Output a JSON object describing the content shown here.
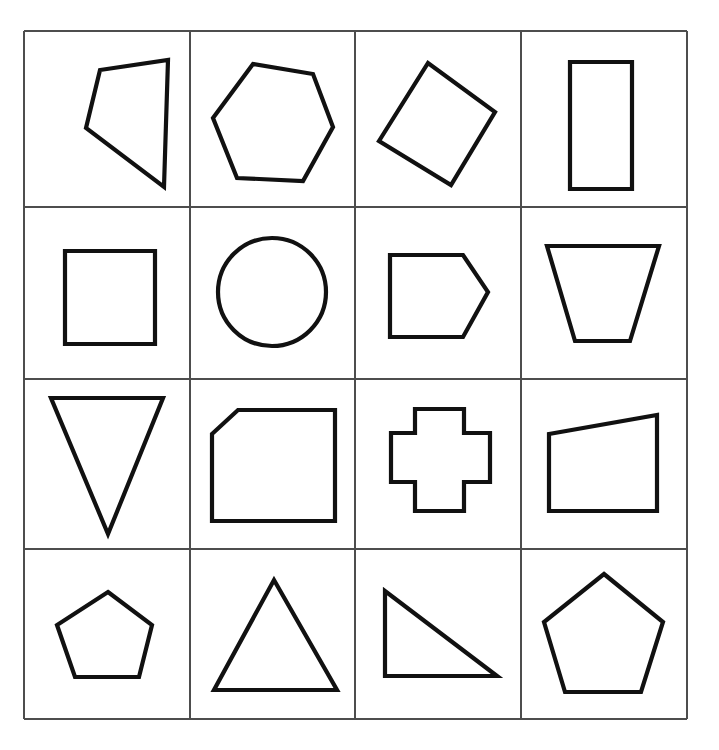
{
  "figure": {
    "rows": 4,
    "columns": 4,
    "shape_count": 16,
    "background_color": "#ffffff",
    "shape_stroke_color": "#111111",
    "shape_fill": "none",
    "shape_stroke_width": 4.2,
    "grid_line_color": "#4d4d4d",
    "grid_line_width": 1.4
  },
  "grid": {
    "x_positions": [
      24,
      190,
      355,
      521,
      687
    ],
    "y_positions": [
      31,
      207,
      379,
      549,
      719
    ]
  },
  "cells": [
    {
      "index": 0,
      "row": 1,
      "column": 1,
      "shape_name": "rotated-rectangle",
      "label": "Rotated rectangle",
      "sides": 4,
      "closed": true,
      "points": "86,128 100,70 168,60 164,187"
    },
    {
      "index": 1,
      "row": 1,
      "column": 2,
      "shape_name": "hexagon",
      "label": "Hexagon",
      "sides": 6,
      "closed": true,
      "points": "213,118 253,64 313,74 333,127 303,181 237,178"
    },
    {
      "index": 2,
      "row": 1,
      "column": 3,
      "shape_name": "rotated-square",
      "label": "Rotated square",
      "sides": 4,
      "closed": true,
      "points": "379,141 428,63 495,112 451,185"
    },
    {
      "index": 3,
      "row": 1,
      "column": 4,
      "shape_name": "upright-rectangle",
      "label": "Upright rectangle",
      "sides": 4,
      "closed": true,
      "points": "570,62 632,62 632,189 570,189"
    },
    {
      "index": 4,
      "row": 2,
      "column": 1,
      "shape_name": "square",
      "label": "Square",
      "sides": 4,
      "closed": true,
      "points": "65,251 155,251 155,344 65,344"
    },
    {
      "index": 5,
      "row": 2,
      "column": 2,
      "shape_name": "circle",
      "label": "Circle",
      "sides": 0,
      "closed": true,
      "circle": {
        "cx": 272,
        "cy": 292,
        "r": 54
      }
    },
    {
      "index": 6,
      "row": 2,
      "column": 3,
      "shape_name": "right-pointing-pentagon",
      "label": "Right-pointing pentagon",
      "sides": 5,
      "closed": true,
      "points": "390,255 463,255 488,292 463,337 390,337"
    },
    {
      "index": 7,
      "row": 2,
      "column": 4,
      "shape_name": "trapezoid",
      "label": "Trapezoid",
      "sides": 4,
      "closed": true,
      "points": "547,246 659,246 630,341 575,341"
    },
    {
      "index": 8,
      "row": 3,
      "column": 1,
      "shape_name": "inverted-triangle",
      "label": "Inverted triangle",
      "sides": 3,
      "closed": true,
      "points": "51,398 163,398 108,534"
    },
    {
      "index": 9,
      "row": 3,
      "column": 2,
      "shape_name": "chamfered-square",
      "label": "Square with clipped top-left corner",
      "sides": 5,
      "closed": true,
      "points": "212,434 238,410 335,410 335,521 212,521"
    },
    {
      "index": 10,
      "row": 3,
      "column": 3,
      "shape_name": "cross",
      "label": "Cross",
      "sides": 12,
      "closed": true,
      "points": "415,409 464,409 464,433 490,433 490,482 464,482 464,511 415,511 415,482 391,482 391,433 415,433"
    },
    {
      "index": 11,
      "row": 3,
      "column": 4,
      "shape_name": "slanted-quadrilateral",
      "label": "Quadrilateral with slanted top edge",
      "sides": 4,
      "closed": true,
      "points": "549,434 657,415 657,511 549,511"
    },
    {
      "index": 12,
      "row": 4,
      "column": 1,
      "shape_name": "wide-pentagon",
      "label": "Wide pentagon",
      "sides": 5,
      "closed": true,
      "points": "108,592 152,625 139,677 75,677 57,625"
    },
    {
      "index": 13,
      "row": 4,
      "column": 2,
      "shape_name": "triangle",
      "label": "Triangle",
      "sides": 3,
      "closed": true,
      "points": "274,580 337,690 214,690"
    },
    {
      "index": 14,
      "row": 4,
      "column": 3,
      "shape_name": "right-triangle",
      "label": "Right triangle",
      "sides": 3,
      "closed": true,
      "points": "385,591 385,676 497,676"
    },
    {
      "index": 15,
      "row": 4,
      "column": 4,
      "shape_name": "pentagon",
      "label": "Pentagon",
      "sides": 5,
      "closed": true,
      "points": "604,574 663,622 641,692 565,692 544,622"
    }
  ]
}
